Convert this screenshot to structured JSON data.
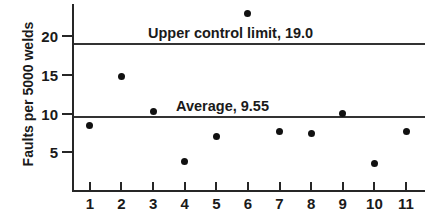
{
  "chart_data": {
    "type": "scatter",
    "title": "",
    "xlabel": "",
    "ylabel": "Faults per 5000 welds",
    "x": [
      1,
      2,
      3,
      4,
      5,
      6,
      7,
      8,
      9,
      10,
      11
    ],
    "values": [
      8.5,
      14.8,
      10.3,
      3.8,
      7.0,
      23.0,
      7.7,
      7.4,
      10.0,
      3.6,
      7.7
    ],
    "xtick_labels": [
      "1",
      "2",
      "3",
      "4",
      "5",
      "6",
      "7",
      "8",
      "9",
      "10",
      "11"
    ],
    "ytick_labels": [
      "5",
      "10",
      "15",
      "20"
    ],
    "ytick_values": [
      5,
      10,
      15,
      20
    ],
    "xlim": [
      0.5,
      11.6
    ],
    "ylim": [
      0,
      24.2
    ],
    "grid": false,
    "legend": "none",
    "reference_lines": [
      {
        "name": "upper-control-limit",
        "label": "Upper control limit, 19.0",
        "value": 19.0
      },
      {
        "name": "average",
        "label": "Average, 9.55",
        "value": 9.55
      }
    ],
    "marker_color": "#111111",
    "line_color": "#333333",
    "axis_color": "#262626"
  }
}
